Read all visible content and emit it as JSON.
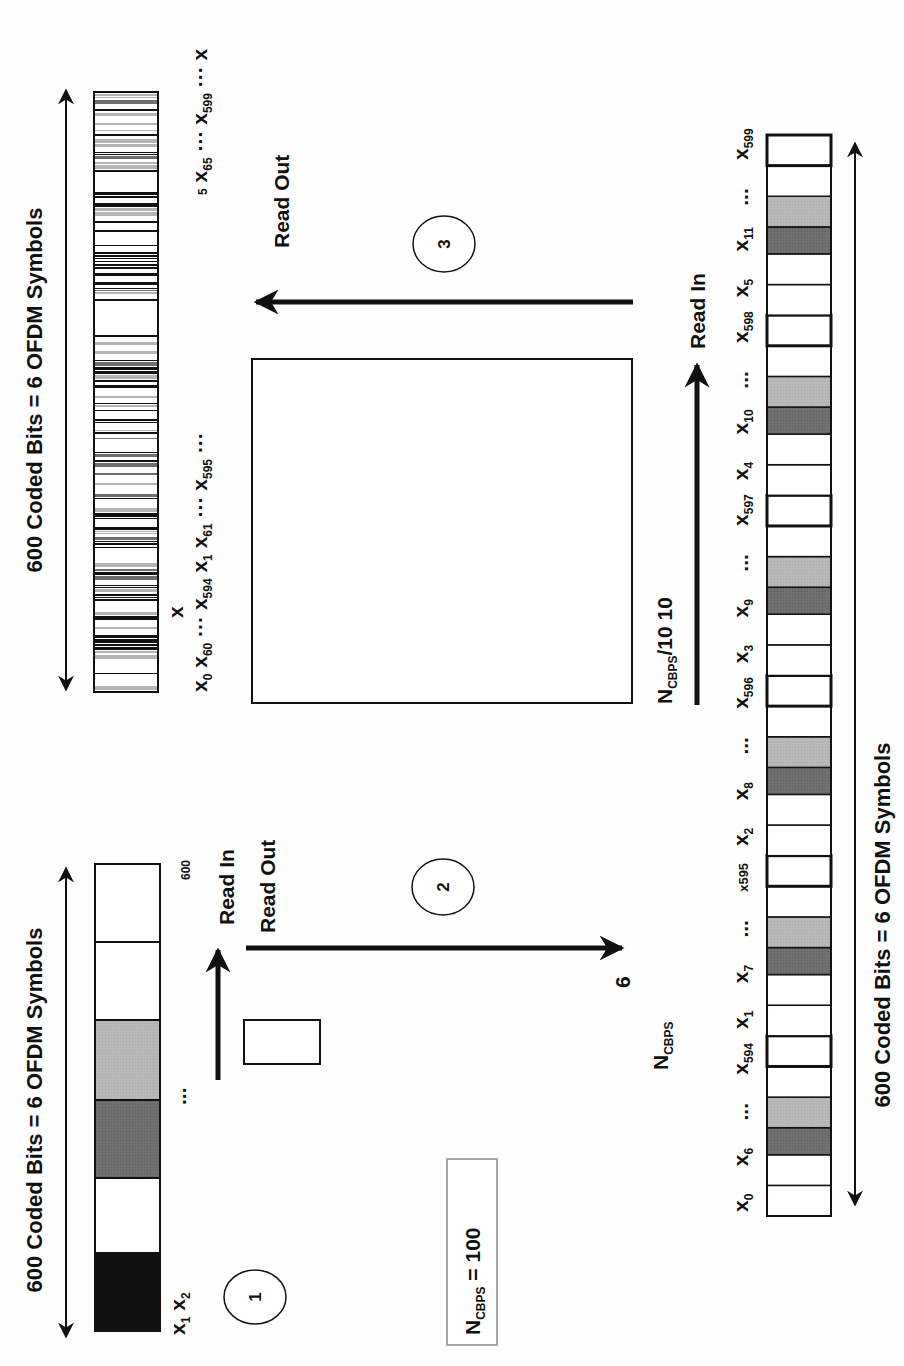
{
  "diagram": {
    "colors": {
      "black": "#111111",
      "dark_gray": "#6e6e6e",
      "light_gray": "#b4b4b4",
      "white": "#ffffff"
    },
    "stage1": {
      "step_number": "1",
      "title": "600 Coded Bits = 6 OFDM Symbols",
      "start_labels": {
        "x1": "x",
        "x1_sub": "1",
        "x2": "x",
        "x2_sub": "2"
      },
      "ellipsis": "...",
      "end_label": "600",
      "cells": [
        "black",
        "white",
        "dark_gray",
        "light_gray",
        "white",
        "white"
      ]
    },
    "ncbps_box": {
      "text": "N",
      "sub": "CBPS",
      "value": " = 100"
    },
    "stage2": {
      "step_number": "2",
      "read_in_label": "Read In",
      "read_out_label": "Read Out",
      "matrix_label": {
        "text": "N",
        "sub": "CBPS",
        "cols": "6"
      }
    },
    "stage3": {
      "step_number": "3",
      "read_in_label": "Read In",
      "read_out_label": "Read Out",
      "matrix_label": {
        "text": "N",
        "sub": "CBPS",
        "div": "/10",
        "cols": "10"
      }
    },
    "stage4": {
      "title": "600 Coded Bits = 6 OFDM Symbols",
      "sequence_labels": [
        {
          "t": "x",
          "s": "0"
        },
        {
          "t": "x",
          "s": "60"
        },
        {
          "t": "...",
          "s": ""
        },
        {
          "t": "x",
          "s": "594"
        },
        {
          "t": "x",
          "s": "1"
        },
        {
          "t": "x",
          "s": "61"
        },
        {
          "t": "...",
          "s": ""
        },
        {
          "t": "x",
          "s": "595"
        },
        {
          "t": "...",
          "s": ""
        },
        {
          "t": "x",
          "s": "5"
        },
        {
          "t": "x",
          "s": "65"
        },
        {
          "t": "...",
          "s": ""
        },
        {
          "t": "x",
          "s": "599"
        },
        {
          "t": "...",
          "s": ""
        },
        {
          "t": "x",
          "s": ""
        }
      ],
      "stray_x": "x"
    },
    "right_bar": {
      "title": "600 Coded Bits = 6 OFDM Symbols",
      "labels": [
        {
          "t": "x",
          "s": "0"
        },
        {
          "t": "x",
          "s": "6"
        },
        {
          "t": "...",
          "s": ""
        },
        {
          "t": "x",
          "s": "594"
        },
        {
          "t": "x",
          "s": "1"
        },
        {
          "t": "x",
          "s": "7"
        },
        {
          "t": "...",
          "s": ""
        },
        {
          "t": "x595",
          "s": ""
        },
        {
          "t": "x",
          "s": "2"
        },
        {
          "t": "x",
          "s": "8"
        },
        {
          "t": "...",
          "s": ""
        },
        {
          "t": "x",
          "s": "596"
        },
        {
          "t": "x",
          "s": "3"
        },
        {
          "t": "x",
          "s": "9"
        },
        {
          "t": "...",
          "s": ""
        },
        {
          "t": "x",
          "s": "597"
        },
        {
          "t": "x",
          "s": "4"
        },
        {
          "t": "x",
          "s": "10"
        },
        {
          "t": "...",
          "s": ""
        },
        {
          "t": "x",
          "s": "598"
        },
        {
          "t": "x",
          "s": "5"
        },
        {
          "t": "x",
          "s": "11"
        },
        {
          "t": "...",
          "s": ""
        },
        {
          "t": "x",
          "s": "599"
        }
      ]
    }
  }
}
